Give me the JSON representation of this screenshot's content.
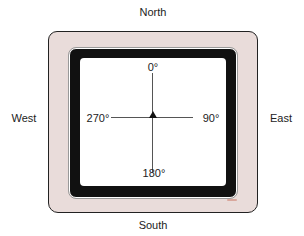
{
  "directions": {
    "north": "North",
    "south": "South",
    "east": "East",
    "west": "West"
  },
  "degrees": {
    "top": "0°",
    "right": "90°",
    "bottom": "180°",
    "left": "270°"
  },
  "colors": {
    "bezel": "#e9dcda",
    "frame": "#111111",
    "screen": "#ffffff",
    "indicator": "#d9a79c"
  }
}
